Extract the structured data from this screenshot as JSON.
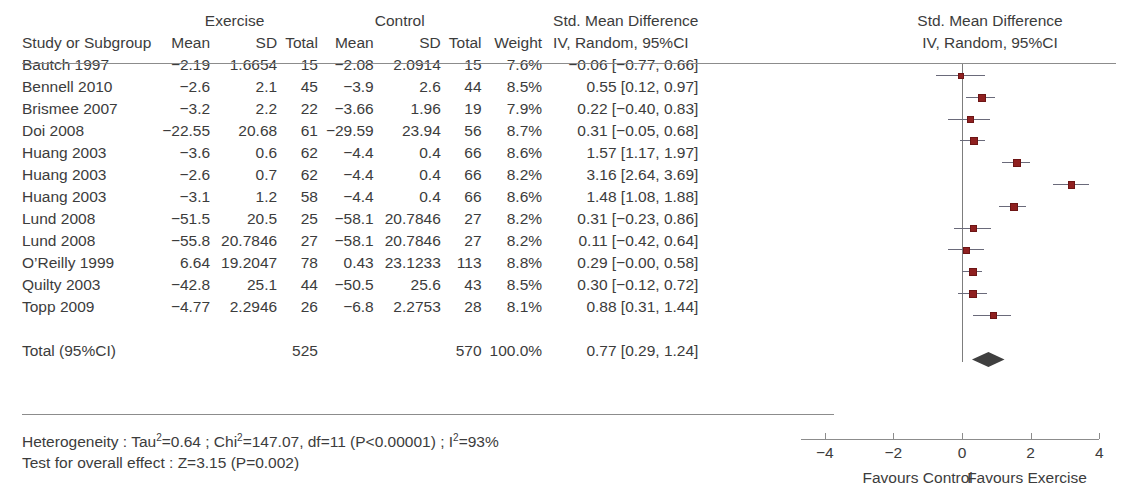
{
  "table": {
    "group_headers": {
      "exercise": "Exercise",
      "control": "Control",
      "effect": "Std. Mean Difference"
    },
    "columns": {
      "study": "Study or Subgroup",
      "e_mean": "Mean",
      "e_sd": "SD",
      "e_total": "Total",
      "c_mean": "Mean",
      "c_sd": "SD",
      "c_total": "Total",
      "weight": "Weight",
      "effect": "IV, Random, 95%CI"
    },
    "rows": [
      {
        "study": "Bautch 1997",
        "e_mean": "−2.19",
        "e_sd": "1.6654",
        "e_total": "15",
        "c_mean": "−2.08",
        "c_sd": "2.0914",
        "c_total": "15",
        "weight": "7.6%",
        "effect": "−0.06 [−0.77,  0.66]"
      },
      {
        "study": "Bennell 2010",
        "e_mean": "−2.6",
        "e_sd": "2.1",
        "e_total": "45",
        "c_mean": "−3.9",
        "c_sd": "2.6",
        "c_total": "44",
        "weight": "8.5%",
        "effect": "0.55 [0.12,  0.97]"
      },
      {
        "study": "Brismee 2007",
        "e_mean": "−3.2",
        "e_sd": "2.2",
        "e_total": "22",
        "c_mean": "−3.66",
        "c_sd": "1.96",
        "c_total": "19",
        "weight": "7.9%",
        "effect": "0.22 [−0.40,  0.83]"
      },
      {
        "study": "Doi 2008",
        "e_mean": "−22.55",
        "e_sd": "20.68",
        "e_total": "61",
        "c_mean": "−29.59",
        "c_sd": "23.94",
        "c_total": "56",
        "weight": "8.7%",
        "effect": "0.31 [−0.05,  0.68]"
      },
      {
        "study": "Huang 2003",
        "e_mean": "−3.6",
        "e_sd": "0.6",
        "e_total": "62",
        "c_mean": "−4.4",
        "c_sd": "0.4",
        "c_total": "66",
        "weight": "8.6%",
        "effect": "1.57 [1.17,  1.97]"
      },
      {
        "study": "Huang 2003",
        "e_mean": "−2.6",
        "e_sd": "0.7",
        "e_total": "62",
        "c_mean": "−4.4",
        "c_sd": "0.4",
        "c_total": "66",
        "weight": "8.2%",
        "effect": "3.16 [2.64,  3.69]"
      },
      {
        "study": "Huang 2003",
        "e_mean": "−3.1",
        "e_sd": "1.2",
        "e_total": "58",
        "c_mean": "−4.4",
        "c_sd": "0.4",
        "c_total": "66",
        "weight": "8.6%",
        "effect": "1.48 [1.08,  1.88]"
      },
      {
        "study": "Lund 2008",
        "e_mean": "−51.5",
        "e_sd": "20.5",
        "e_total": "25",
        "c_mean": "−58.1",
        "c_sd": "20.7846",
        "c_total": "27",
        "weight": "8.2%",
        "effect": "0.31 [−0.23,  0.86]"
      },
      {
        "study": "Lund 2008",
        "e_mean": "−55.8",
        "e_sd": "20.7846",
        "e_total": "27",
        "c_mean": "−58.1",
        "c_sd": "20.7846",
        "c_total": "27",
        "weight": "8.2%",
        "effect": "0.11 [−0.42,  0.64]"
      },
      {
        "study": "O’Reilly 1999",
        "e_mean": "6.64",
        "e_sd": "19.2047",
        "e_total": "78",
        "c_mean": "0.43",
        "c_sd": "23.1233",
        "c_total": "113",
        "weight": "8.8%",
        "effect": "0.29 [−0.00,  0.58]"
      },
      {
        "study": "Quilty 2003",
        "e_mean": "−42.8",
        "e_sd": "25.1",
        "e_total": "44",
        "c_mean": "−50.5",
        "c_sd": "25.6",
        "c_total": "43",
        "weight": "8.5%",
        "effect": "0.30 [−0.12,  0.72]"
      },
      {
        "study": "Topp 2009",
        "e_mean": "−4.77",
        "e_sd": "2.2946",
        "e_total": "26",
        "c_mean": "−6.8",
        "c_sd": "2.2753",
        "c_total": "28",
        "weight": "8.1%",
        "effect": "0.88 [0.31,  1.44]"
      }
    ],
    "total_row": {
      "study": "Total (95%CI)",
      "e_total": "525",
      "c_total": "570",
      "weight": "100.0%",
      "effect": "0.77 [0.29,  1.24]"
    }
  },
  "stats": {
    "heterogeneity_prefix": "Heterogeneity : Tau",
    "heterogeneity_mid1": "=0.64 ; Chi",
    "heterogeneity_mid2": "=147.07,  df=11 (P<0.00001) ; I",
    "heterogeneity_suffix": "=93%",
    "sup_square": "2",
    "overall_effect": "Test for overall effect : Z=3.15 (P=0.002)"
  },
  "plot": {
    "title_line1": "Std. Mean Difference",
    "title_line2": "IV, Random, 95%CI",
    "favours_left": "Favours Control",
    "favours_right": "Favours Exercise",
    "marker_color": "#8f2020",
    "ci_color": "#6a6a7a",
    "diamond_color": "#3f3f3f",
    "axis_color": "#8c8c8c"
  },
  "chart_data": {
    "type": "forest",
    "title": "Std. Mean Difference IV, Random, 95%CI",
    "xlabel": "Std. Mean Difference",
    "xlim": [
      -4,
      4
    ],
    "xticks": [
      "−4",
      "−2",
      "0",
      "2",
      "4"
    ],
    "xtick_values": [
      -4,
      -2,
      0,
      2,
      4
    ],
    "null_line": 0,
    "grid": false,
    "legend": "none",
    "favours_left_label": "Favours Control",
    "favours_right_label": "Favours Exercise",
    "studies": [
      {
        "label": "Bautch 1997",
        "estimate": -0.06,
        "ci_low": -0.77,
        "ci_high": 0.66,
        "weight": 7.6
      },
      {
        "label": "Bennell 2010",
        "estimate": 0.55,
        "ci_low": 0.12,
        "ci_high": 0.97,
        "weight": 8.5
      },
      {
        "label": "Brismee 2007",
        "estimate": 0.22,
        "ci_low": -0.4,
        "ci_high": 0.83,
        "weight": 7.9
      },
      {
        "label": "Doi 2008",
        "estimate": 0.31,
        "ci_low": -0.05,
        "ci_high": 0.68,
        "weight": 8.7
      },
      {
        "label": "Huang 2003",
        "estimate": 1.57,
        "ci_low": 1.17,
        "ci_high": 1.97,
        "weight": 8.6
      },
      {
        "label": "Huang 2003",
        "estimate": 3.16,
        "ci_low": 2.64,
        "ci_high": 3.69,
        "weight": 8.2
      },
      {
        "label": "Huang 2003",
        "estimate": 1.48,
        "ci_low": 1.08,
        "ci_high": 1.88,
        "weight": 8.6
      },
      {
        "label": "Lund 2008",
        "estimate": 0.31,
        "ci_low": -0.23,
        "ci_high": 0.86,
        "weight": 8.2
      },
      {
        "label": "Lund 2008",
        "estimate": 0.11,
        "ci_low": -0.42,
        "ci_high": 0.64,
        "weight": 8.2
      },
      {
        "label": "O’Reilly 1999",
        "estimate": 0.29,
        "ci_low": -0.0,
        "ci_high": 0.58,
        "weight": 8.8
      },
      {
        "label": "Quilty 2003",
        "estimate": 0.3,
        "ci_low": -0.12,
        "ci_high": 0.72,
        "weight": 8.5
      },
      {
        "label": "Topp 2009",
        "estimate": 0.88,
        "ci_low": 0.31,
        "ci_high": 1.44,
        "weight": 8.1
      }
    ],
    "overall": {
      "label": "Total (95%CI)",
      "estimate": 0.77,
      "ci_low": 0.29,
      "ci_high": 1.24,
      "weight": 100.0
    },
    "heterogeneity": {
      "tau2": 0.64,
      "chi2": 147.07,
      "df": 11,
      "p": "<0.00001",
      "i2": "93%"
    },
    "overall_test": {
      "z": 3.15,
      "p": 0.002
    },
    "totals": {
      "exercise": 525,
      "control": 570
    }
  }
}
